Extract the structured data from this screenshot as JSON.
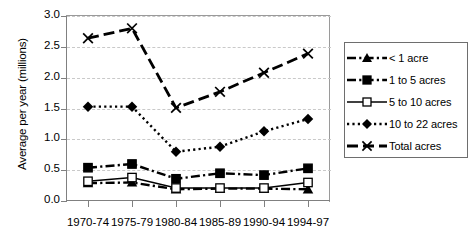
{
  "chart_data": {
    "type": "line",
    "title": "",
    "xlabel": "",
    "ylabel": "Average per year (millions)",
    "categories": [
      "1970-74",
      "1975-79",
      "1980-84",
      "1985-89",
      "1990-94",
      "1994-97"
    ],
    "ylim": [
      0.0,
      3.0
    ],
    "ytick_labels": [
      "0.0",
      "0.5",
      "1.0",
      "1.5",
      "2.0",
      "2.5",
      "3.0"
    ],
    "ytick_values": [
      0.0,
      0.5,
      1.0,
      1.5,
      2.0,
      2.5,
      3.0
    ],
    "grid": true,
    "legend_position": "right",
    "series": [
      {
        "name": "< 1 acre",
        "marker": "filled-triangle",
        "linestyle": "dash-dot",
        "values": [
          0.29,
          0.3,
          0.19,
          0.2,
          0.2,
          0.19
        ]
      },
      {
        "name": "1 to 5 acres",
        "marker": "filled-square",
        "linestyle": "dash-dot",
        "values": [
          0.54,
          0.6,
          0.36,
          0.45,
          0.42,
          0.53
        ]
      },
      {
        "name": "5 to 10 acres",
        "marker": "open-square",
        "linestyle": "solid",
        "values": [
          0.32,
          0.38,
          0.21,
          0.21,
          0.21,
          0.3
        ]
      },
      {
        "name": "10 to 22 acres",
        "marker": "filled-diamond",
        "linestyle": "dotted",
        "values": [
          1.53,
          1.53,
          0.8,
          0.88,
          1.13,
          1.33
        ]
      },
      {
        "name": "Total acres",
        "marker": "cross-x",
        "linestyle": "long-dash",
        "values": [
          2.64,
          2.8,
          1.51,
          1.77,
          2.08,
          2.39
        ]
      }
    ],
    "colors": {
      "line": "#000000",
      "grid": "#c9c9c9",
      "axis": "#808080",
      "background": "#ffffff"
    }
  },
  "legend": {
    "items": [
      {
        "label": "< 1 acre"
      },
      {
        "label": "1 to 5 acres"
      },
      {
        "label": "5 to 10 acres"
      },
      {
        "label": "10 to 22 acres"
      },
      {
        "label": "Total acres"
      }
    ]
  }
}
